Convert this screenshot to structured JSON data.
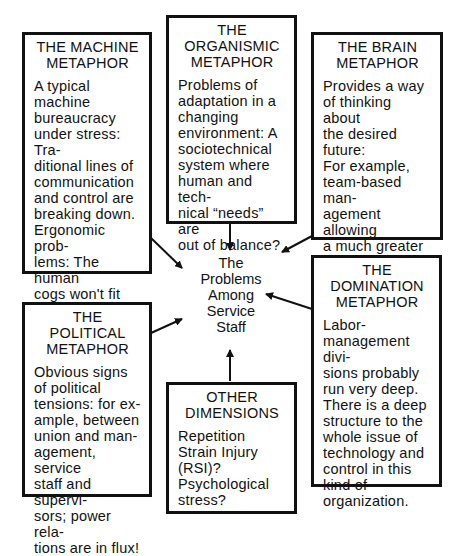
{
  "header_fragment": "Some text cut off",
  "center": {
    "label": "The\nProblems\nAmong\nService\nStaff"
  },
  "boxes": {
    "machine": {
      "title": "THE MACHINE\nMETAPHOR",
      "body": "A typical\nmachine\nbureaucracy\nunder stress: Tra-\nditional lines of\ncommunication\nand control are\nbreaking down.\nErgonomic prob-\nlems: The human\ncogs won't fit the\nmachine!"
    },
    "organismic": {
      "title": "THE\nORGANISMIC\nMETAPHOR",
      "body": "Problems of\nadaptation in a\nchanging\nenvironment: A\nsociotechnical\nsystem where\nhuman and tech-\nnical “needs” are\nout of balance?"
    },
    "brain": {
      "title": "THE BRAIN\nMETAPHOR",
      "body": "Provides a way\nof thinking about\nthe desired future:\nFor example,\nteam-based man-\nagement allowing\na much greater\ndegree of auton-\nomy and self-\norganization?"
    },
    "domination": {
      "title": "THE\nDOMINATION\nMETAPHOR",
      "body": "Labor-\nmanagement divi-\nsions probably\nrun very deep.\nThere is a deep\nstructure to the\nwhole issue of\ntechnology and\ncontrol in this\nkind of\norganization."
    },
    "political": {
      "title": "THE POLITICAL\nMETAPHOR",
      "body": "Obvious signs\nof political\ntensions: for ex-\nample, between\nunion and man-\nagement, service\nstaff and supervi-\nsors; power rela-\ntions are in flux!"
    },
    "other": {
      "title": "OTHER\nDIMENSIONS",
      "body": "Repetition\nStrain Injury\n(RSI)?\nPsychological\nstress?"
    }
  },
  "colors": {
    "line": "#111111",
    "background": "#ffffff"
  }
}
